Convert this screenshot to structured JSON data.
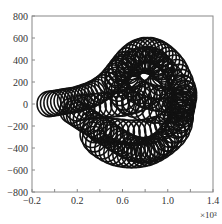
{
  "chart_data": {
    "type": "scatter",
    "title": "",
    "xlabel": "",
    "ylabel": "",
    "x_multiplier_label": "×10³",
    "xlim": [
      -0.2,
      1.4
    ],
    "ylim": [
      -800,
      800
    ],
    "xticks": [
      -0.2,
      0.0,
      0.2,
      0.4,
      0.6,
      0.8,
      1.0,
      1.2,
      1.4
    ],
    "xtick_labels": [
      "-0.2",
      "",
      "0.2",
      "",
      "0.6",
      "",
      "1.0",
      "",
      "1.4"
    ],
    "yticks": [
      800,
      600,
      400,
      200,
      0,
      -200,
      -400,
      -600,
      -800
    ],
    "ytick_labels": [
      "800",
      "600",
      "400",
      "200",
      "0",
      "−200",
      "−400",
      "−600",
      "−800"
    ],
    "grid": false,
    "legend": null,
    "marker": "open-circle",
    "marker_color": "#111111",
    "circle_radius_x": 0.105,
    "circle_radius_y": 115,
    "series": [
      {
        "name": "trajectory",
        "description": "Chain of overlapping open circles tracing a looping path: left stem along y≈0, upper lobe reaching y≈600, right side to x≈1.25e3, lower lobe down to y≈-580.",
        "points": [
          [
            -0.05,
            0
          ],
          [
            -0.02,
            5
          ],
          [
            0.01,
            10
          ],
          [
            0.04,
            15
          ],
          [
            0.07,
            20
          ],
          [
            0.1,
            25
          ],
          [
            0.13,
            30
          ],
          [
            0.16,
            35
          ],
          [
            0.19,
            40
          ],
          [
            0.22,
            50
          ],
          [
            0.25,
            60
          ],
          [
            0.28,
            70
          ],
          [
            0.31,
            80
          ],
          [
            0.34,
            95
          ],
          [
            0.37,
            110
          ],
          [
            0.4,
            130
          ],
          [
            0.43,
            150
          ],
          [
            0.46,
            175
          ],
          [
            0.49,
            205
          ],
          [
            0.52,
            240
          ],
          [
            0.55,
            280
          ],
          [
            0.58,
            320
          ],
          [
            0.61,
            360
          ],
          [
            0.64,
            395
          ],
          [
            0.67,
            425
          ],
          [
            0.7,
            450
          ],
          [
            0.73,
            468
          ],
          [
            0.76,
            480
          ],
          [
            0.79,
            488
          ],
          [
            0.82,
            490
          ],
          [
            0.85,
            488
          ],
          [
            0.88,
            480
          ],
          [
            0.91,
            468
          ],
          [
            0.94,
            450
          ],
          [
            0.97,
            428
          ],
          [
            1.0,
            400
          ],
          [
            1.03,
            368
          ],
          [
            1.06,
            330
          ],
          [
            1.08,
            290
          ],
          [
            1.1,
            245
          ],
          [
            1.12,
            200
          ],
          [
            1.13,
            150
          ],
          [
            1.14,
            100
          ],
          [
            1.14,
            50
          ],
          [
            1.14,
            0
          ],
          [
            1.13,
            -50
          ],
          [
            1.12,
            -100
          ],
          [
            1.1,
            -150
          ],
          [
            1.08,
            -195
          ],
          [
            1.05,
            -240
          ],
          [
            1.02,
            -280
          ],
          [
            0.99,
            -315
          ],
          [
            0.96,
            -345
          ],
          [
            0.93,
            -370
          ],
          [
            0.9,
            -390
          ],
          [
            0.87,
            -405
          ],
          [
            0.84,
            -415
          ],
          [
            0.81,
            -420
          ],
          [
            0.78,
            -420
          ],
          [
            0.75,
            -418
          ],
          [
            0.72,
            -412
          ],
          [
            0.69,
            -402
          ],
          [
            0.66,
            -390
          ],
          [
            0.63,
            -375
          ],
          [
            0.6,
            -358
          ],
          [
            0.57,
            -340
          ],
          [
            0.54,
            -320
          ],
          [
            0.51,
            -300
          ],
          [
            0.48,
            -280
          ],
          [
            0.45,
            -260
          ],
          [
            0.42,
            -240
          ],
          [
            0.39,
            -220
          ],
          [
            0.36,
            -200
          ],
          [
            0.33,
            -180
          ],
          [
            0.3,
            -160
          ],
          [
            0.27,
            -140
          ],
          [
            0.24,
            -120
          ],
          [
            0.21,
            -100
          ],
          [
            0.18,
            -80
          ],
          [
            0.15,
            -60
          ],
          [
            0.2,
            -40
          ],
          [
            0.25,
            -30
          ],
          [
            0.3,
            -25
          ],
          [
            0.35,
            -20
          ],
          [
            0.4,
            -15
          ],
          [
            0.45,
            -10
          ],
          [
            0.5,
            -5
          ],
          [
            0.55,
            0
          ],
          [
            0.6,
            5
          ],
          [
            0.65,
            15
          ],
          [
            0.7,
            30
          ],
          [
            0.75,
            50
          ],
          [
            0.8,
            80
          ],
          [
            0.85,
            115
          ],
          [
            0.9,
            155
          ],
          [
            0.93,
            195
          ],
          [
            0.95,
            235
          ],
          [
            0.96,
            275
          ],
          [
            0.95,
            315
          ],
          [
            0.93,
            350
          ],
          [
            0.9,
            380
          ],
          [
            0.86,
            400
          ],
          [
            0.82,
            410
          ],
          [
            0.78,
            405
          ],
          [
            0.74,
            390
          ],
          [
            0.7,
            365
          ],
          [
            0.67,
            335
          ],
          [
            0.65,
            300
          ],
          [
            0.64,
            260
          ],
          [
            0.65,
            220
          ],
          [
            0.67,
            180
          ],
          [
            0.7,
            145
          ],
          [
            0.74,
            115
          ],
          [
            0.78,
            90
          ],
          [
            0.83,
            70
          ],
          [
            0.88,
            55
          ],
          [
            0.93,
            45
          ],
          [
            0.98,
            40
          ],
          [
            1.03,
            35
          ],
          [
            1.07,
            25
          ],
          [
            1.1,
            10
          ],
          [
            1.12,
            -10
          ],
          [
            1.12,
            -40
          ],
          [
            1.1,
            -80
          ],
          [
            1.07,
            -120
          ],
          [
            1.03,
            -155
          ],
          [
            0.99,
            -185
          ],
          [
            0.95,
            -210
          ],
          [
            0.9,
            -230
          ],
          [
            0.85,
            -245
          ],
          [
            0.8,
            -255
          ],
          [
            0.75,
            -260
          ],
          [
            0.7,
            -262
          ],
          [
            0.65,
            -260
          ],
          [
            0.6,
            -255
          ],
          [
            0.55,
            -250
          ],
          [
            0.5,
            -245
          ],
          [
            0.45,
            -240
          ],
          [
            0.4,
            -238
          ],
          [
            0.35,
            -236
          ],
          [
            0.33,
            -280
          ],
          [
            0.35,
            -320
          ],
          [
            0.38,
            -355
          ],
          [
            0.42,
            -385
          ],
          [
            0.46,
            -410
          ],
          [
            0.5,
            -430
          ],
          [
            0.54,
            -445
          ],
          [
            0.58,
            -455
          ],
          [
            0.62,
            -462
          ],
          [
            0.66,
            -465
          ],
          [
            0.7,
            -465
          ],
          [
            0.74,
            -462
          ],
          [
            0.78,
            -455
          ],
          [
            0.82,
            -445
          ],
          [
            0.86,
            -430
          ],
          [
            0.9,
            -410
          ],
          [
            0.94,
            -385
          ],
          [
            0.98,
            -355
          ],
          [
            1.02,
            -320
          ],
          [
            1.06,
            -280
          ],
          [
            1.09,
            -235
          ],
          [
            1.11,
            -185
          ],
          [
            1.12,
            -130
          ],
          [
            1.12,
            -75
          ],
          [
            1.12,
            -20
          ],
          [
            1.11,
            35
          ],
          [
            1.1,
            90
          ],
          [
            1.08,
            145
          ],
          [
            1.05,
            200
          ],
          [
            1.02,
            250
          ],
          [
            0.98,
            295
          ],
          [
            0.94,
            335
          ],
          [
            0.9,
            365
          ],
          [
            0.85,
            385
          ],
          [
            0.8,
            395
          ],
          [
            0.75,
            395
          ],
          [
            0.7,
            385
          ],
          [
            0.65,
            365
          ],
          [
            0.61,
            335
          ],
          [
            0.58,
            300
          ],
          [
            0.56,
            260
          ],
          [
            0.55,
            220
          ],
          [
            0.55,
            180
          ],
          [
            0.56,
            140
          ],
          [
            0.58,
            100
          ],
          [
            0.61,
            60
          ],
          [
            0.65,
            25
          ],
          [
            0.7,
            -5
          ],
          [
            0.76,
            -30
          ],
          [
            0.82,
            -50
          ],
          [
            0.88,
            -60
          ],
          [
            0.94,
            -62
          ],
          [
            1.0,
            -58
          ],
          [
            1.05,
            -48
          ],
          [
            1.09,
            -30
          ],
          [
            1.12,
            -5
          ],
          [
            1.14,
            25
          ],
          [
            1.15,
            60
          ],
          [
            1.15,
            100
          ],
          [
            1.14,
            140
          ]
        ]
      }
    ]
  }
}
